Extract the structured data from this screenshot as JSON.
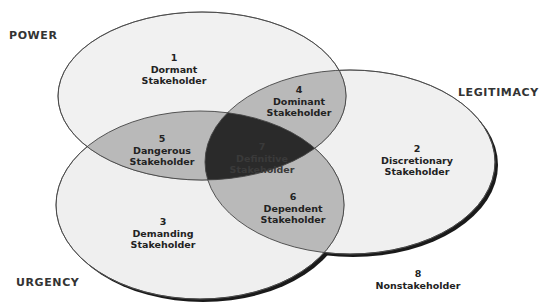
{
  "diagram": {
    "type": "venn",
    "attributes": {
      "power": "POWER",
      "legitimacy": "LEGITIMACY",
      "urgency": "URGENCY"
    },
    "regions": [
      {
        "number": "1",
        "name": "Dormant",
        "suffix": "Stakeholder"
      },
      {
        "number": "2",
        "name": "Discretionary",
        "suffix": "Stakeholder"
      },
      {
        "number": "3",
        "name": "Demanding",
        "suffix": "Stakeholder"
      },
      {
        "number": "4",
        "name": "Dominant",
        "suffix": "Stakeholder"
      },
      {
        "number": "5",
        "name": "Dangerous",
        "suffix": "Stakeholder"
      },
      {
        "number": "6",
        "name": "Dependent",
        "suffix": "Stakeholder"
      },
      {
        "number": "7",
        "name": "Definitive",
        "suffix": "Stakeholder"
      },
      {
        "number": "8",
        "name": "Nonstakeholder",
        "suffix": ""
      }
    ],
    "colors": {
      "single": "#efefef",
      "double": "#b8b8b8",
      "triple": "#2a2a2a",
      "outline": "#444444",
      "shadow": "#1a1a1a"
    }
  }
}
